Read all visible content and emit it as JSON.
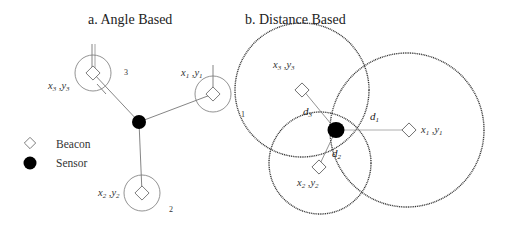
{
  "panel_a": {
    "title": "a. Angle Based",
    "beacons": [
      {
        "id": "1",
        "label_x": "x",
        "label_xsub": "1",
        "label_y": "y",
        "label_ysub": "1",
        "number": "1"
      },
      {
        "id": "2",
        "label_x": "x",
        "label_xsub": "2",
        "label_y": "y",
        "label_ysub": "2",
        "number": "2"
      },
      {
        "id": "3",
        "label_x": "x",
        "label_xsub": "3",
        "label_y": "y",
        "label_ysub": "3",
        "number": "3"
      }
    ]
  },
  "panel_b": {
    "title": "b. Distance Based",
    "beacons": [
      {
        "id": "1",
        "label_x": "x",
        "label_xsub": "1",
        "label_y": "y",
        "label_ysub": "1",
        "distance": "d",
        "distance_sub": "1"
      },
      {
        "id": "2",
        "label_x": "x",
        "label_xsub": "2",
        "label_y": "y",
        "label_ysub": "2",
        "distance": "d",
        "distance_sub": "2"
      },
      {
        "id": "3",
        "label_x": "x",
        "label_xsub": "3",
        "label_y": "y",
        "label_ysub": "3",
        "distance": "d",
        "distance_sub": "3"
      }
    ]
  },
  "legend": {
    "beacon_label": "Beacon",
    "sensor_label": "Sensor"
  },
  "colors": {
    "line": "#555555",
    "sensor": "#000000",
    "dotted_circle": "#333333"
  }
}
